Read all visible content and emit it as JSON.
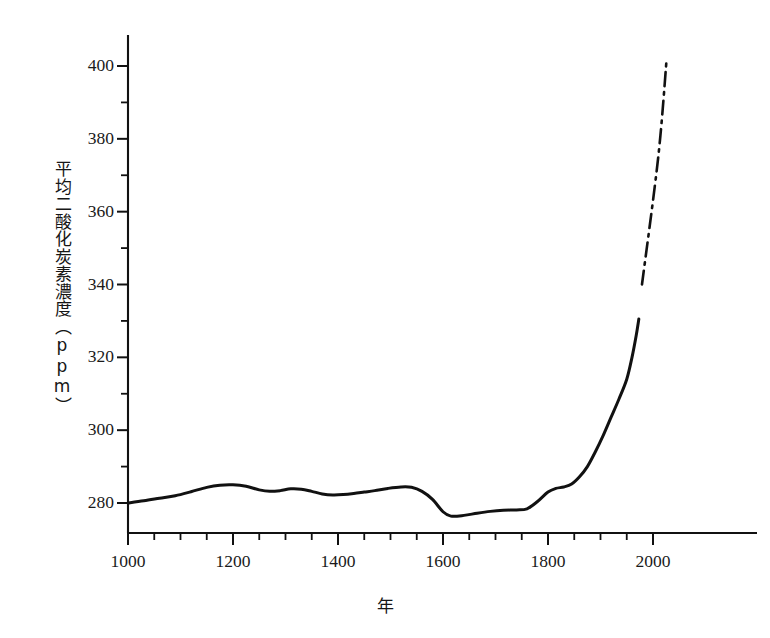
{
  "chart_data": {
    "type": "line",
    "title": "",
    "subtitle": "",
    "xlabel": "年",
    "ylabel": "平均二酸化炭素濃度（ppm）",
    "xlim": [
      980,
      2070
    ],
    "ylim": [
      268,
      408
    ],
    "grid": false,
    "legend": "none",
    "x_ticks_major": [
      1000,
      1200,
      1400,
      1600,
      1800,
      2000
    ],
    "x_tick_labels": [
      "1000",
      "1200",
      "1400",
      "1600",
      "1800",
      "2000"
    ],
    "x_ticks_minor_step": 50,
    "y_ticks_major": [
      280,
      300,
      320,
      340,
      360,
      380,
      400
    ],
    "y_tick_labels": [
      "280",
      "300",
      "320",
      "340",
      "360",
      "380",
      "400"
    ],
    "y_ticks_minor_step": 10,
    "axis_style": "left-and-bottom-spine",
    "series": [
      {
        "name": "観測値",
        "style": "solid",
        "color": "#111111",
        "points": [
          [
            1000,
            280.0
          ],
          [
            1030,
            280.6
          ],
          [
            1060,
            281.3
          ],
          [
            1090,
            282.0
          ],
          [
            1120,
            283.1
          ],
          [
            1150,
            284.3
          ],
          [
            1175,
            284.9
          ],
          [
            1200,
            285.0
          ],
          [
            1225,
            284.6
          ],
          [
            1250,
            283.6
          ],
          [
            1270,
            283.2
          ],
          [
            1290,
            283.4
          ],
          [
            1310,
            283.9
          ],
          [
            1330,
            283.8
          ],
          [
            1350,
            283.2
          ],
          [
            1370,
            282.5
          ],
          [
            1390,
            282.2
          ],
          [
            1410,
            282.3
          ],
          [
            1430,
            282.6
          ],
          [
            1450,
            283.0
          ],
          [
            1470,
            283.4
          ],
          [
            1495,
            284.0
          ],
          [
            1520,
            284.4
          ],
          [
            1540,
            284.3
          ],
          [
            1560,
            283.2
          ],
          [
            1580,
            281.0
          ],
          [
            1600,
            277.6
          ],
          [
            1615,
            276.4
          ],
          [
            1640,
            276.6
          ],
          [
            1665,
            277.2
          ],
          [
            1690,
            277.7
          ],
          [
            1715,
            278.0
          ],
          [
            1740,
            278.1
          ],
          [
            1760,
            278.4
          ],
          [
            1780,
            280.4
          ],
          [
            1800,
            283.0
          ],
          [
            1815,
            284.0
          ],
          [
            1830,
            284.4
          ],
          [
            1845,
            285.2
          ],
          [
            1860,
            287.2
          ],
          [
            1875,
            290.0
          ],
          [
            1890,
            294.0
          ],
          [
            1905,
            298.5
          ],
          [
            1920,
            303.5
          ],
          [
            1935,
            308.5
          ],
          [
            1950,
            314.0
          ],
          [
            1960,
            320.0
          ],
          [
            1968,
            326.0
          ],
          [
            1973,
            330.5
          ]
        ]
      },
      {
        "name": "将来予測",
        "style": "dash-dot",
        "color": "#111111",
        "points": [
          [
            1979,
            340.0
          ],
          [
            2010,
            375.0
          ],
          [
            2026,
            402.0
          ]
        ]
      }
    ],
    "annotations": []
  },
  "axis": {
    "y_label_text": "平均二酸化炭素濃度（ppm）",
    "x_label_text": "年"
  }
}
